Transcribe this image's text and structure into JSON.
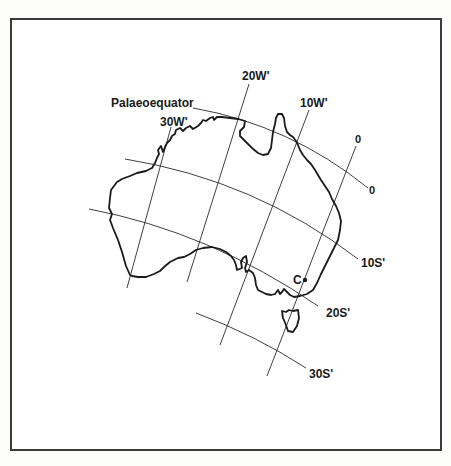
{
  "figure": {
    "title_label": "Palaeoequator",
    "meridian_labels": {
      "m30": "30W'",
      "m20": "20W'",
      "m10": "10W'",
      "m0": "0"
    },
    "parallel_labels": {
      "p0": "0",
      "p10": "10S'",
      "p20": "20S'",
      "p30": "30S'"
    },
    "site_marker_label": "C",
    "colors": {
      "line": "#1a1a1a",
      "border": "#3a3a3a",
      "background": "#ffffff"
    }
  }
}
